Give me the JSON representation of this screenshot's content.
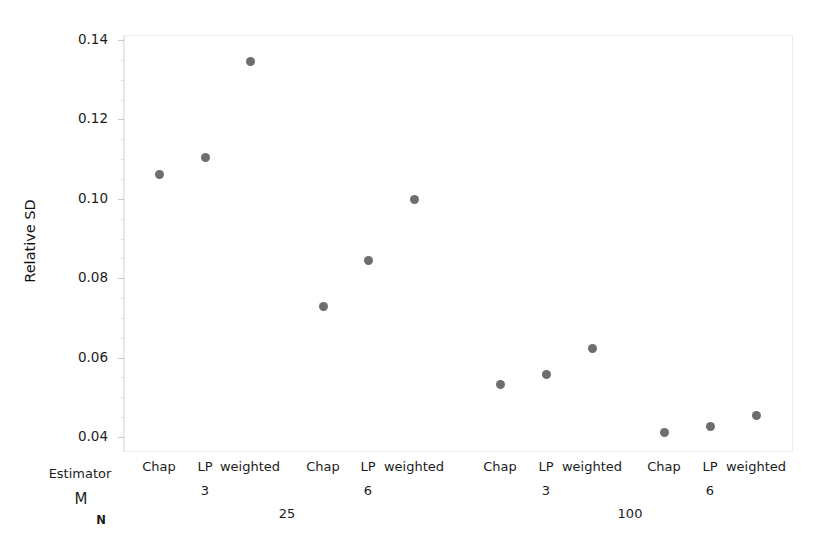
{
  "chart_data": {
    "type": "scatter",
    "title": "",
    "xlabel": "",
    "ylabel": "Relative SD",
    "ylim": [
      0.035,
      0.142
    ],
    "yticks": [
      0.04,
      0.06,
      0.08,
      0.1,
      0.12,
      0.14
    ],
    "ytick_labels": [
      "0.04",
      "0.06",
      "0.08",
      "0.10",
      "0.12",
      "0.14"
    ],
    "grid": false,
    "legend": null,
    "point_color": "#6e6e6e",
    "frame_color": "#ededed",
    "axis_row_headers": [
      "Estimator",
      "M",
      "N"
    ],
    "x_group_levels": {
      "N": [
        "25",
        "100"
      ],
      "M": [
        "3",
        "6",
        "3",
        "6"
      ],
      "Estimator": [
        "Chap",
        "LP",
        "weighted"
      ]
    },
    "categories": [
      "N=25, M=3, Chap",
      "N=25, M=3, LP",
      "N=25, M=3, weighted",
      "N=25, M=6, Chap",
      "N=25, M=6, LP",
      "N=25, M=6, weighted",
      "N=100, M=3, Chap",
      "N=100, M=3, LP",
      "N=100, M=3, weighted",
      "N=100, M=6, Chap",
      "N=100, M=6, LP",
      "N=100, M=6, weighted"
    ],
    "values": [
      0.106,
      0.1105,
      0.1345,
      0.0728,
      0.0845,
      0.0997,
      0.0532,
      0.0558,
      0.0623,
      0.0411,
      0.0426,
      0.0453
    ],
    "points": [
      {
        "label": "Chap",
        "x_px": 159,
        "value": 0.106
      },
      {
        "label": "LP",
        "x_px": 205,
        "value": 0.1105
      },
      {
        "label": "weighted",
        "x_px": 250,
        "value": 0.1345
      },
      {
        "label": "Chap",
        "x_px": 323,
        "value": 0.0728
      },
      {
        "label": "LP",
        "x_px": 368,
        "value": 0.0845
      },
      {
        "label": "weighted",
        "x_px": 414,
        "value": 0.0997
      },
      {
        "label": "Chap",
        "x_px": 500,
        "value": 0.0532
      },
      {
        "label": "LP",
        "x_px": 546,
        "value": 0.0558
      },
      {
        "label": "weighted",
        "x_px": 592,
        "value": 0.0623
      },
      {
        "label": "Chap",
        "x_px": 664,
        "value": 0.0411
      },
      {
        "label": "LP",
        "x_px": 710,
        "value": 0.0426
      },
      {
        "label": "weighted",
        "x_px": 756,
        "value": 0.0453
      }
    ],
    "estimator_row": [
      {
        "text": "Chap",
        "x_px": 159
      },
      {
        "text": "LP",
        "x_px": 205
      },
      {
        "text": "weighted",
        "x_px": 250
      },
      {
        "text": "Chap",
        "x_px": 323
      },
      {
        "text": "LP",
        "x_px": 368
      },
      {
        "text": "weighted",
        "x_px": 414
      },
      {
        "text": "Chap",
        "x_px": 500
      },
      {
        "text": "LP",
        "x_px": 546
      },
      {
        "text": "weighted",
        "x_px": 592
      },
      {
        "text": "Chap",
        "x_px": 664
      },
      {
        "text": "LP",
        "x_px": 710
      },
      {
        "text": "weighted",
        "x_px": 756
      }
    ],
    "m_row": [
      {
        "text": "3",
        "x_px": 205
      },
      {
        "text": "6",
        "x_px": 368
      },
      {
        "text": "3",
        "x_px": 546
      },
      {
        "text": "6",
        "x_px": 710
      }
    ],
    "n_row": [
      {
        "text": "25",
        "x_px": 287
      },
      {
        "text": "100",
        "x_px": 630
      }
    ],
    "row_labels": {
      "estimator": {
        "text": "Estimator",
        "x_px": 80,
        "y_px": 466
      },
      "m": {
        "text": "M",
        "x_px": 81,
        "y_px": 490
      },
      "n": {
        "text": "N",
        "x_px": 101,
        "y_px": 513
      }
    }
  }
}
